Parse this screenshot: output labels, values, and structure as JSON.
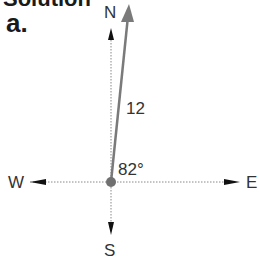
{
  "heading": {
    "text": "Solution"
  },
  "part_label": "a.",
  "compass": {
    "north": "N",
    "south": "S",
    "east": "E",
    "west": "W"
  },
  "vector": {
    "magnitude_label": "12",
    "angle_label": "82°",
    "color": "#7a7a7a"
  },
  "axis_color": "#666666",
  "arrowhead_color": "#111111"
}
